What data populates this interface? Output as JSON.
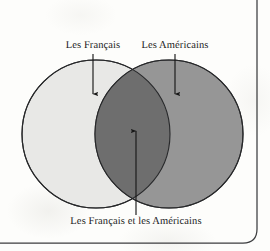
{
  "figure": {
    "type": "venn-diagram",
    "sets_count": 2,
    "background_color": "#fdfdfb",
    "labels": {
      "left_set": "Les Français",
      "right_set": "Les Américains",
      "intersection": "Les Français et les Américains"
    },
    "icons": {
      "left_arrow": "arrow-down-icon",
      "right_arrow": "arrow-down-icon",
      "intersection_arrow": "arrow-up-icon"
    },
    "colors": {
      "left_circle_fill": "#e8e8e6",
      "right_circle_fill": "#969696",
      "intersection_fill": "#6e6e6e",
      "circle_stroke": "#27282a",
      "arrow_color": "#191919",
      "page_border": "#3c3d3f",
      "text_color": "#19191a"
    },
    "geometry": {
      "left_circle": {
        "cx": 96,
        "cy": 134,
        "r": 74
      },
      "right_circle": {
        "cx": 169,
        "cy": 134,
        "r": 74
      },
      "intersection_x_range": [
        100,
        168
      ]
    },
    "page_border": {
      "right_edge_x": 257,
      "bottom_edge_y": 243,
      "corner_radius": 14,
      "sides_visible": "right-and-bottom"
    }
  }
}
